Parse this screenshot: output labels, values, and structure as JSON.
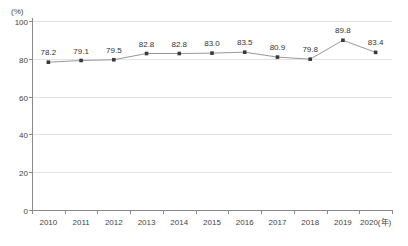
{
  "chart_data": {
    "type": "line",
    "title": "",
    "subtitle": "",
    "xlabel": "(年)",
    "ylabel": "(%)",
    "unit_label": "(%)",
    "x_axis_suffix": "(年)",
    "categories": [
      "2010",
      "2011",
      "2012",
      "2013",
      "2014",
      "2015",
      "2016",
      "2017",
      "2018",
      "2019",
      "2020"
    ],
    "x_tick_labels": [
      "2010",
      "2011",
      "2012",
      "2013",
      "2014",
      "2015",
      "2016",
      "2017",
      "2018",
      "2019",
      "2020(年)"
    ],
    "values": [
      78.2,
      79.1,
      79.5,
      82.8,
      82.8,
      83.0,
      83.5,
      80.9,
      79.8,
      89.8,
      83.4
    ],
    "data_labels": [
      "78.2",
      "79.1",
      "79.5",
      "82.8",
      "82.8",
      "83.0",
      "83.5",
      "80.9",
      "79.8",
      "89.8",
      "83.4"
    ],
    "ylim": [
      0,
      100
    ],
    "y_ticks": [
      0,
      20,
      40,
      60,
      80,
      100
    ],
    "y_tick_labels": [
      "0",
      "20",
      "40",
      "60",
      "80",
      "100"
    ],
    "grid": true,
    "grid_axis": "y",
    "legend": false,
    "legend_position": "none",
    "colors": {
      "line": "#999999",
      "marker": "#3a3a3a",
      "grid": "#e2e2e2",
      "axis": "#8a8a8a",
      "text": "#444444",
      "background": "#ffffff"
    }
  }
}
